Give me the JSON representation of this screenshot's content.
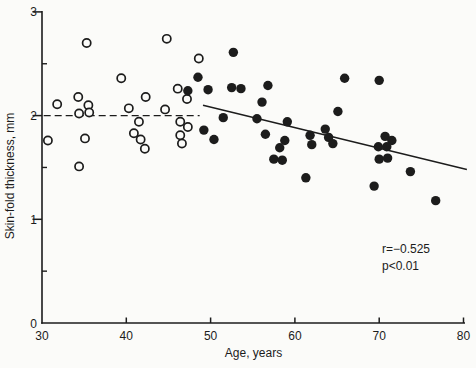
{
  "figure": {
    "type": "scanned-scatter-plot",
    "background": "#fbfbf9",
    "ink_color": "#1c1c1c"
  },
  "chart_data": {
    "type": "scatter",
    "title": "",
    "xlabel": "Age, years",
    "ylabel": "Skin-fold thickness, mm",
    "xlim": [
      30,
      80
    ],
    "ylim": [
      0,
      3
    ],
    "x_ticks": [
      30,
      40,
      50,
      60,
      70,
      80
    ],
    "y_ticks": [
      0,
      1,
      2,
      3
    ],
    "y_minor_ticks": [
      0.5,
      1.5,
      2.5
    ],
    "grid": false,
    "legend_position": "none",
    "series": [
      {
        "name": "open-circles",
        "marker": "open-circle",
        "points": [
          [
            35.3,
            2.7
          ],
          [
            44.8,
            2.74
          ],
          [
            48.6,
            2.55
          ],
          [
            39.4,
            2.36
          ],
          [
            31.8,
            2.11
          ],
          [
            34.3,
            2.18
          ],
          [
            35.5,
            2.1
          ],
          [
            34.4,
            2.02
          ],
          [
            35.6,
            2.03
          ],
          [
            40.3,
            2.07
          ],
          [
            42.3,
            2.18
          ],
          [
            41.5,
            1.94
          ],
          [
            44.6,
            2.06
          ],
          [
            46.1,
            2.26
          ],
          [
            47.2,
            2.16
          ],
          [
            30.7,
            1.76
          ],
          [
            35.1,
            1.78
          ],
          [
            40.9,
            1.83
          ],
          [
            41.7,
            1.77
          ],
          [
            42.2,
            1.68
          ],
          [
            34.4,
            1.51
          ],
          [
            46.4,
            1.94
          ],
          [
            47.3,
            1.89
          ],
          [
            46.4,
            1.81
          ],
          [
            46.6,
            1.73
          ]
        ]
      },
      {
        "name": "filled-circles",
        "marker": "filled-circle",
        "points": [
          [
            52.7,
            2.61
          ],
          [
            48.5,
            2.37
          ],
          [
            49.7,
            2.25
          ],
          [
            52.5,
            2.27
          ],
          [
            53.6,
            2.26
          ],
          [
            56.8,
            2.29
          ],
          [
            56.1,
            2.13
          ],
          [
            51.5,
            1.98
          ],
          [
            55.5,
            1.97
          ],
          [
            59.1,
            1.94
          ],
          [
            56.5,
            1.82
          ],
          [
            58.8,
            1.76
          ],
          [
            49.2,
            1.86
          ],
          [
            50.4,
            1.77
          ],
          [
            58.2,
            1.69
          ],
          [
            57.5,
            1.58
          ],
          [
            58.5,
            1.57
          ],
          [
            61.3,
            1.4
          ],
          [
            61.8,
            1.81
          ],
          [
            62.0,
            1.72
          ],
          [
            63.6,
            1.87
          ],
          [
            64.0,
            1.79
          ],
          [
            64.5,
            1.73
          ],
          [
            65.9,
            2.36
          ],
          [
            70.0,
            2.34
          ],
          [
            65.1,
            2.04
          ],
          [
            70.7,
            1.8
          ],
          [
            71.5,
            1.76
          ],
          [
            69.9,
            1.7
          ],
          [
            70.9,
            1.7
          ],
          [
            70.0,
            1.58
          ],
          [
            71.0,
            1.59
          ],
          [
            73.7,
            1.46
          ],
          [
            69.4,
            1.32
          ],
          [
            76.7,
            1.18
          ],
          [
            47.3,
            2.24
          ]
        ]
      }
    ],
    "lines": [
      {
        "name": "mean-dashed-line",
        "style": "dashed",
        "from": [
          30.2,
          2.0
        ],
        "to": [
          48.7,
          2.0
        ]
      },
      {
        "name": "regression-line",
        "style": "solid",
        "from": [
          49.1,
          2.1
        ],
        "to": [
          80.4,
          1.48
        ]
      }
    ],
    "annotations": [
      {
        "text": "r=−0.525"
      },
      {
        "text": "p<0.01"
      }
    ]
  }
}
